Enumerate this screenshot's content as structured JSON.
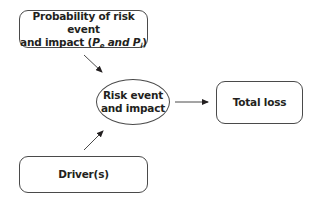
{
  "diagram": {
    "nodes": {
      "probability": {
        "line1": "Probability of risk event",
        "line2_prefix": "and impact (",
        "p_symbol": "P",
        "sub_e": "e",
        "and_word": " and ",
        "sub_i": "i",
        "line2_suffix": ")",
        "shape": "rounded-rectangle"
      },
      "risk_event": {
        "line1": "Risk event",
        "line2": "and impact",
        "shape": "ellipse"
      },
      "total_loss": {
        "label": "Total loss",
        "shape": "rounded-rectangle"
      },
      "drivers": {
        "label": "Driver(s)",
        "shape": "rounded-rectangle"
      }
    },
    "edges": [
      {
        "from": "probability",
        "to": "risk_event"
      },
      {
        "from": "drivers",
        "to": "risk_event"
      },
      {
        "from": "risk_event",
        "to": "total_loss"
      }
    ],
    "colors": {
      "stroke": "#4a4a4a",
      "text": "#231f20",
      "background": "#ffffff"
    }
  }
}
